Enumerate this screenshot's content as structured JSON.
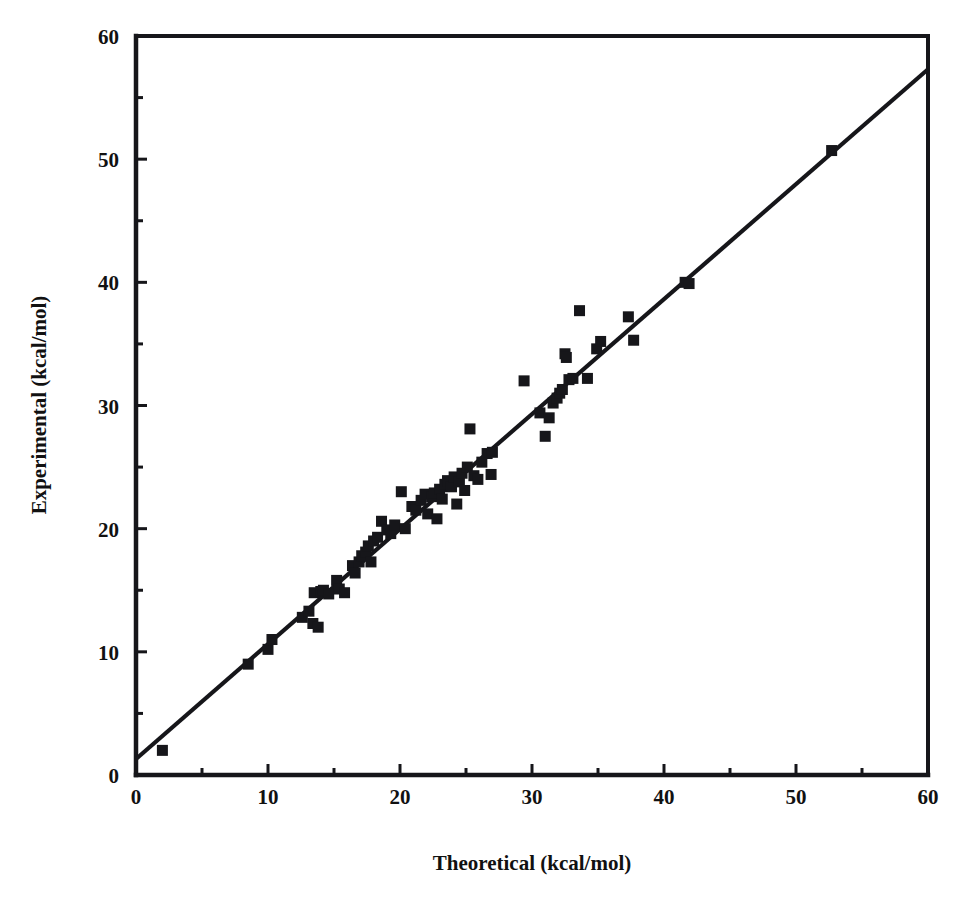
{
  "figure": {
    "background_color": "#ffffff",
    "ink_color": "#16161a",
    "marker_shape": "filled-square",
    "marker_size_px": 11
  },
  "chart_data": {
    "type": "scatter",
    "title": "",
    "xlabel": "Theoretical (kcal/mol)",
    "ylabel": "Experimental (kcal/mol)",
    "xlim": [
      0,
      60
    ],
    "ylim": [
      0,
      60
    ],
    "grid": false,
    "legend": null,
    "x_major_ticks": [
      0,
      10,
      20,
      30,
      40,
      50,
      60
    ],
    "y_major_ticks": [
      0,
      10,
      20,
      30,
      40,
      50,
      60
    ],
    "x_minor_ticks": [
      5,
      15,
      25,
      35,
      45,
      55
    ],
    "y_minor_ticks": [
      5,
      15,
      25,
      35,
      45,
      55
    ],
    "x_tick_labels": [
      "0",
      "10",
      "20",
      "30",
      "40",
      "50",
      "60"
    ],
    "y_tick_labels": [
      "0",
      "10",
      "20",
      "30",
      "40",
      "50",
      "60"
    ],
    "annotations": [],
    "fit_line": {
      "label": "identity / regression line",
      "x_start": 0.0,
      "y_start": 1.3,
      "x_end": 60.0,
      "y_end": 57.3
    },
    "series": [
      {
        "name": "Solvation free energies",
        "marker": "filled-square",
        "color": "#16161a",
        "points": [
          [
            2.0,
            2.0
          ],
          [
            8.5,
            9.0
          ],
          [
            10.0,
            10.2
          ],
          [
            10.3,
            11.0
          ],
          [
            12.6,
            12.8
          ],
          [
            13.1,
            13.3
          ],
          [
            13.4,
            12.3
          ],
          [
            13.5,
            14.8
          ],
          [
            13.8,
            12.0
          ],
          [
            14.0,
            14.9
          ],
          [
            14.2,
            15.0
          ],
          [
            14.6,
            14.7
          ],
          [
            15.2,
            15.8
          ],
          [
            15.4,
            15.1
          ],
          [
            15.8,
            14.8
          ],
          [
            16.4,
            17.0
          ],
          [
            16.6,
            16.4
          ],
          [
            16.9,
            17.3
          ],
          [
            17.1,
            17.8
          ],
          [
            17.4,
            18.1
          ],
          [
            17.6,
            18.6
          ],
          [
            17.8,
            17.3
          ],
          [
            18.0,
            19.0
          ],
          [
            18.3,
            19.3
          ],
          [
            18.6,
            20.6
          ],
          [
            19.0,
            19.9
          ],
          [
            19.3,
            19.6
          ],
          [
            19.6,
            20.3
          ],
          [
            20.1,
            23.0
          ],
          [
            20.4,
            20.0
          ],
          [
            20.9,
            21.8
          ],
          [
            21.2,
            21.5
          ],
          [
            21.6,
            22.3
          ],
          [
            21.9,
            22.8
          ],
          [
            22.1,
            21.2
          ],
          [
            22.4,
            22.6
          ],
          [
            22.6,
            22.9
          ],
          [
            22.8,
            20.8
          ],
          [
            23.0,
            23.2
          ],
          [
            23.2,
            22.4
          ],
          [
            23.4,
            23.6
          ],
          [
            23.6,
            23.9
          ],
          [
            23.9,
            23.4
          ],
          [
            24.1,
            24.2
          ],
          [
            24.3,
            22.0
          ],
          [
            24.5,
            23.8
          ],
          [
            24.7,
            24.5
          ],
          [
            24.9,
            23.1
          ],
          [
            25.1,
            25.0
          ],
          [
            25.3,
            28.1
          ],
          [
            25.6,
            24.3
          ],
          [
            25.9,
            24.0
          ],
          [
            26.2,
            25.4
          ],
          [
            26.6,
            26.1
          ],
          [
            26.9,
            24.4
          ],
          [
            27.0,
            26.2
          ],
          [
            29.4,
            32.0
          ],
          [
            30.6,
            29.4
          ],
          [
            31.0,
            27.5
          ],
          [
            31.3,
            29.0
          ],
          [
            31.6,
            30.2
          ],
          [
            31.9,
            30.6
          ],
          [
            32.1,
            31.0
          ],
          [
            32.3,
            31.3
          ],
          [
            32.5,
            34.2
          ],
          [
            32.6,
            33.9
          ],
          [
            32.8,
            32.1
          ],
          [
            33.1,
            32.2
          ],
          [
            33.6,
            37.7
          ],
          [
            34.2,
            32.2
          ],
          [
            34.9,
            34.6
          ],
          [
            35.2,
            35.2
          ],
          [
            37.3,
            37.2
          ],
          [
            37.7,
            35.3
          ],
          [
            41.6,
            40.0
          ],
          [
            41.9,
            39.9
          ],
          [
            52.7,
            50.7
          ]
        ]
      }
    ]
  },
  "axes_geometry": {
    "left_px": 136,
    "right_px": 928,
    "top_px": 36,
    "bottom_px": 775
  }
}
